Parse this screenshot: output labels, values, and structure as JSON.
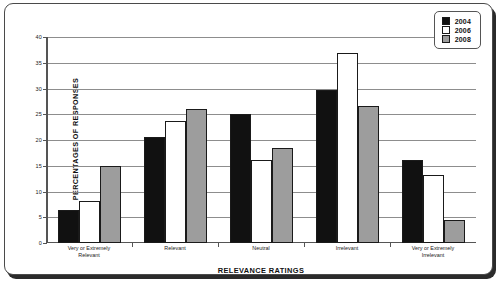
{
  "chart_data": {
    "type": "bar",
    "title": "",
    "xlabel": "RELEVANCE RATINGS",
    "ylabel": "PERCENTAGES OF RESPONSES",
    "ylim": [
      0,
      40
    ],
    "ytick_step": 5,
    "yticks": [
      "40",
      "35",
      "30",
      "25",
      "20",
      "15",
      "10",
      "5",
      "0"
    ],
    "grid": true,
    "legend_position": "top-right",
    "categories": [
      "Very or Extremely Relevant",
      "Relevant",
      "Neutral",
      "Irrelevant",
      "Very or Extremely Irrelevant"
    ],
    "category_lines": [
      [
        "Very or Extremely",
        "Relevant"
      ],
      [
        "Relevant"
      ],
      [
        "Neutral"
      ],
      [
        "Irrelevant"
      ],
      [
        "Very or Extremely",
        "Irrelevant"
      ]
    ],
    "series": [
      {
        "name": "2004",
        "color": "#111111",
        "values": [
          6.5,
          20.5,
          25.0,
          29.8,
          16.2
        ]
      },
      {
        "name": "2006",
        "color": "#ffffff",
        "values": [
          8.2,
          23.6,
          16.1,
          36.8,
          13.3
        ]
      },
      {
        "name": "2008",
        "color": "#9d9d9d",
        "values": [
          15.0,
          26.1,
          18.5,
          26.6,
          4.5
        ]
      }
    ]
  },
  "legend": {
    "items": [
      {
        "label": "2004",
        "swatch": "black-swatch-icon"
      },
      {
        "label": "2006",
        "swatch": "white-swatch-icon"
      },
      {
        "label": "2008",
        "swatch": "gray-swatch-icon"
      }
    ]
  },
  "caption": {
    "text": ""
  }
}
